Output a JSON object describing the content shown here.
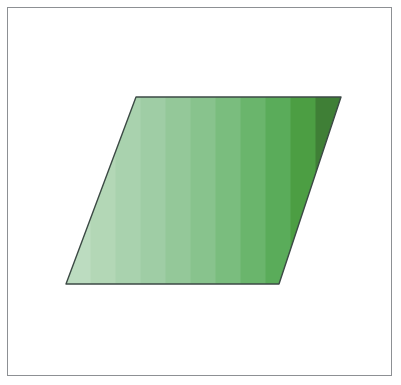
{
  "canvas": {
    "width": 401,
    "height": 385,
    "background_color": "#ffffff"
  },
  "frame": {
    "label": "figure-border",
    "x": 7,
    "y": 7,
    "width": 385,
    "height": 369,
    "stroke_color": "#8d9094",
    "stroke_width": 1,
    "fill_color": "#ffffff"
  },
  "figure": {
    "shape_type": "parallelogram",
    "outline_color": "#3c4a45",
    "outline_width": 1.4,
    "vertices": [
      {
        "name": "top-left",
        "x": 136,
        "y": 97
      },
      {
        "name": "top-right",
        "x": 341,
        "y": 97
      },
      {
        "name": "bottom-right",
        "x": 279,
        "y": 284
      },
      {
        "name": "bottom-left",
        "x": 66,
        "y": 284
      }
    ],
    "top_edge_length": 205,
    "bottom_edge_length": 213,
    "height": 187,
    "slant_offset_x": 70,
    "gradient": {
      "direction": "horizontal-left-to-right",
      "style": "discrete-bands",
      "band_count": 11,
      "band_colors": [
        "#bcdcc0",
        "#b3d7b6",
        "#a9d2ae",
        "#9fcda5",
        "#94c899",
        "#88c38d",
        "#7abd7e",
        "#6ab56c",
        "#5aac5a",
        "#4c9e43",
        "#3f7f36"
      ],
      "lightest_color": "#bcdcc0",
      "darkest_color": "#3f7f36"
    }
  }
}
